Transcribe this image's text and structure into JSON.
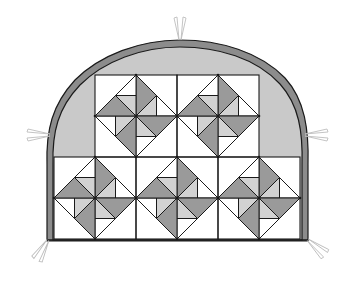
{
  "diagram": {
    "type": "quilt-pattern",
    "colors": {
      "background": "#ffffff",
      "outer_border": "#8c8c8c",
      "arch_fill": "#c9c9c9",
      "dark_patch": "#9a9a9a",
      "light_patch": "#d2d2d2",
      "white_patch": "#ffffff",
      "line": "#1a1a1a",
      "marker": "#bdbdbd"
    },
    "grid": {
      "block_size": 82,
      "top_row": {
        "y": 75,
        "x_positions": [
          95,
          177
        ],
        "blocks_with_pinwheel": [
          true,
          true
        ]
      },
      "bottom_row": {
        "y": 157,
        "x_positions": [
          54,
          136,
          218
        ],
        "blocks_with_pinwheel": [
          true,
          true,
          true
        ]
      }
    },
    "block_count": 5,
    "markers": [
      {
        "name": "top-marker",
        "x": 180,
        "y": 40,
        "angle": 90
      },
      {
        "name": "left-marker",
        "x": 50,
        "y": 135,
        "angle": 180
      },
      {
        "name": "right-marker",
        "x": 305,
        "y": 135,
        "angle": 0
      },
      {
        "name": "bottom-left-marker",
        "x": 48,
        "y": 240,
        "angle": 240
      },
      {
        "name": "bottom-right-marker",
        "x": 308,
        "y": 240,
        "angle": 320
      }
    ]
  }
}
